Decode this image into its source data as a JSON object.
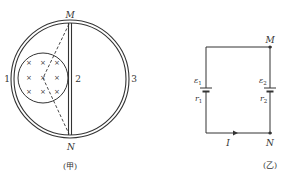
{
  "figure_a": {
    "caption": "(甲)",
    "labels": {
      "top": "M",
      "bottom": "N",
      "left": "1",
      "middle": "2",
      "right": "3"
    },
    "field_symbol": "×"
  },
  "figure_b": {
    "caption": "(乙)",
    "labels": {
      "top": "M",
      "bottom": "N",
      "emf1": "ε",
      "emf1_sub": "1",
      "r1": "r",
      "r1_sub": "1",
      "emf2": "ε",
      "emf2_sub": "2",
      "r2": "r",
      "r2_sub": "2",
      "current": "I"
    }
  },
  "colors": {
    "stroke": "#333333",
    "background": "#ffffff"
  }
}
